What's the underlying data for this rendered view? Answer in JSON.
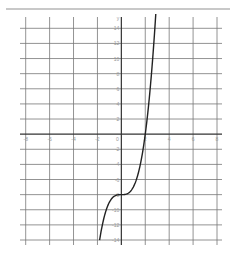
{
  "chart_data": {
    "type": "line",
    "title": "",
    "xlabel": "",
    "ylabel": "y",
    "xlim": [
      -8,
      8
    ],
    "ylim": [
      -14,
      14
    ],
    "grid": true,
    "x_ticks": [
      -8,
      -6,
      -4,
      -2,
      0,
      2,
      4,
      6,
      8
    ],
    "y_ticks": [
      14,
      12,
      10,
      8,
      6,
      4,
      2,
      -2,
      -4,
      -6,
      -8,
      -10,
      -12,
      -14
    ],
    "series": [
      {
        "name": "f(x) = x^3 - 8",
        "x": [
          -1.82,
          -1.5,
          -1.0,
          -0.5,
          0.0,
          0.5,
          1.0,
          1.5,
          2.0,
          2.5,
          2.88
        ],
        "values": [
          -14.0,
          -11.4,
          -9.0,
          -8.1,
          -8.0,
          -7.9,
          -7.0,
          -4.6,
          0.0,
          7.6,
          15.9
        ]
      }
    ],
    "legend": null,
    "colors": {
      "grid": "#777777",
      "axis": "#333333",
      "curve": "#222222",
      "rule": "#c8c8c8"
    }
  }
}
